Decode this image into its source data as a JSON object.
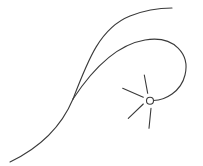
{
  "diagram": {
    "stroke_color": "#3a3a3a",
    "background": "#ffffff",
    "curves": [
      {
        "name": "stem",
        "path": "M10,162 C35,150 60,130 73,99"
      },
      {
        "name": "upper-branch",
        "path": "M73,99 C88,60 100,28 130,16 C145,10 160,8 172,8"
      },
      {
        "name": "lower-branch-loop",
        "path": "M73,99 C92,70 115,45 145,40 C175,35 190,55 185,75 C181,92 165,100 153.5,100.5"
      }
    ],
    "node": {
      "cx": 150,
      "cy": 100.7,
      "r": 3.5
    },
    "rays": [
      {
        "x1": 144.3,
        "y1": 75,
        "x2": 147.7,
        "y2": 93.3
      },
      {
        "x1": 122.7,
        "y1": 88.3,
        "x2": 143.3,
        "y2": 97.3
      },
      {
        "x1": 128.3,
        "y1": 118.3,
        "x2": 143.3,
        "y2": 104
      },
      {
        "x1": 151,
        "y1": 108.3,
        "x2": 149,
        "y2": 128.3
      }
    ]
  }
}
